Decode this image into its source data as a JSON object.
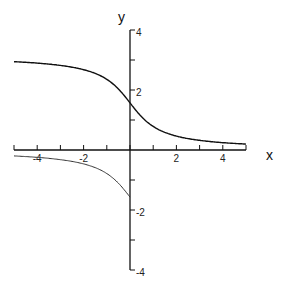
{
  "chart_data": {
    "type": "line",
    "title": "",
    "xlabel": "x",
    "ylabel": "y",
    "xlim": [
      -5,
      5
    ],
    "ylim": [
      -4,
      4
    ],
    "grid": false,
    "legend": null,
    "x_ticks": [
      -4,
      -2,
      2,
      4
    ],
    "y_ticks": [
      -4,
      -2,
      2,
      4
    ],
    "x_minor_step": 1,
    "y_minor_step": 1,
    "series": [
      {
        "name": "upper branch (arccot x)",
        "x": [
          -5,
          -4,
          -3,
          -2,
          -1,
          -0.5,
          0,
          0.5,
          1,
          2,
          3,
          4,
          5
        ],
        "values": [
          2.94,
          2.9,
          2.82,
          2.68,
          2.36,
          2.03,
          1.57,
          1.11,
          0.79,
          0.46,
          0.32,
          0.24,
          0.2
        ],
        "color": "#111111"
      },
      {
        "name": "lower branch (arctan(1/x), x<0)",
        "x": [
          -5,
          -4,
          -3,
          -2,
          -1,
          -0.5,
          -0.01
        ],
        "values": [
          -0.2,
          -0.24,
          -0.32,
          -0.46,
          -0.79,
          -1.11,
          -1.56
        ],
        "color": "#333333"
      }
    ]
  },
  "labels": {
    "x_axis": "x",
    "y_axis": "y",
    "x_tick_labels": [
      "-4",
      "-2",
      "2",
      "4"
    ],
    "y_tick_labels": [
      "4",
      "2",
      "-2",
      "-4"
    ]
  }
}
